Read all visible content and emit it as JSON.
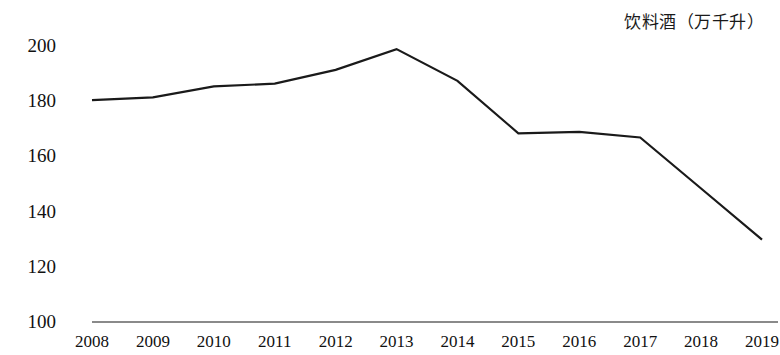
{
  "chart_data": {
    "type": "line",
    "title": "饮料酒（万千升）",
    "xlabel": "",
    "ylabel": "",
    "categories": [
      "2008",
      "2009",
      "2010",
      "2011",
      "2012",
      "2013",
      "2014",
      "2015",
      "2016",
      "2017",
      "2018",
      "2019"
    ],
    "values": [
      180,
      181,
      185,
      186,
      191,
      198.5,
      187,
      168,
      168.5,
      166.5,
      148,
      129.5
    ],
    "series": [
      {
        "name": "饮料酒（万千升）",
        "values": [
          180,
          181,
          185,
          186,
          191,
          198.5,
          187,
          168,
          168.5,
          166.5,
          148,
          129.5
        ]
      }
    ],
    "ylim": [
      100,
      200
    ],
    "yticks": [
      100,
      120,
      140,
      160,
      180,
      200
    ],
    "ytick_labels": [
      "100",
      "120",
      "140",
      "160",
      "180",
      "200"
    ],
    "grid": false,
    "legend": false,
    "legend_position": "none",
    "line_color": "#1a1a1a",
    "axis_color": "#8a8a8a",
    "background_color": "#ffffff",
    "markers": false
  }
}
